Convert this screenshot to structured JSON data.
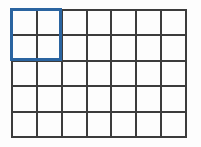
{
  "figure": {
    "title": "",
    "background_color": "#fdfdfd"
  },
  "grid": {
    "columns": 7,
    "rows": 5,
    "total_cells": 35,
    "line_color": "#3c3c3c",
    "line_width_px": 2,
    "cell_fill": "none",
    "origin_px": {
      "x": 11,
      "y": 9
    },
    "size_px": {
      "width": 176,
      "height": 129
    },
    "cell_size_px": {
      "width": 25,
      "height": 25.8
    },
    "cells": [
      {
        "row": 1,
        "col": 1,
        "selected": true
      },
      {
        "row": 1,
        "col": 2,
        "selected": true
      },
      {
        "row": 1,
        "col": 3,
        "selected": false
      },
      {
        "row": 1,
        "col": 4,
        "selected": false
      },
      {
        "row": 1,
        "col": 5,
        "selected": false
      },
      {
        "row": 1,
        "col": 6,
        "selected": false
      },
      {
        "row": 1,
        "col": 7,
        "selected": false
      },
      {
        "row": 2,
        "col": 1,
        "selected": true
      },
      {
        "row": 2,
        "col": 2,
        "selected": true
      },
      {
        "row": 2,
        "col": 3,
        "selected": false
      },
      {
        "row": 2,
        "col": 4,
        "selected": false
      },
      {
        "row": 2,
        "col": 5,
        "selected": false
      },
      {
        "row": 2,
        "col": 6,
        "selected": false
      },
      {
        "row": 2,
        "col": 7,
        "selected": false
      },
      {
        "row": 3,
        "col": 1,
        "selected": false
      },
      {
        "row": 3,
        "col": 2,
        "selected": false
      },
      {
        "row": 3,
        "col": 3,
        "selected": false
      },
      {
        "row": 3,
        "col": 4,
        "selected": false
      },
      {
        "row": 3,
        "col": 5,
        "selected": false
      },
      {
        "row": 3,
        "col": 6,
        "selected": false
      },
      {
        "row": 3,
        "col": 7,
        "selected": false
      },
      {
        "row": 4,
        "col": 1,
        "selected": false
      },
      {
        "row": 4,
        "col": 2,
        "selected": false
      },
      {
        "row": 4,
        "col": 3,
        "selected": false
      },
      {
        "row": 4,
        "col": 4,
        "selected": false
      },
      {
        "row": 4,
        "col": 5,
        "selected": false
      },
      {
        "row": 4,
        "col": 6,
        "selected": false
      },
      {
        "row": 4,
        "col": 7,
        "selected": false
      },
      {
        "row": 5,
        "col": 1,
        "selected": false
      },
      {
        "row": 5,
        "col": 2,
        "selected": false
      },
      {
        "row": 5,
        "col": 3,
        "selected": false
      },
      {
        "row": 5,
        "col": 4,
        "selected": false
      },
      {
        "row": 5,
        "col": 5,
        "selected": false
      },
      {
        "row": 5,
        "col": 6,
        "selected": false
      },
      {
        "row": 5,
        "col": 7,
        "selected": false
      }
    ]
  },
  "selection": {
    "label": "",
    "color": "#2a64a0",
    "border_width_px": 3,
    "span_columns": 2,
    "span_rows": 5,
    "start_row": 1,
    "start_col": 1,
    "end_row": 2,
    "end_col": 2,
    "cells_covered": 4,
    "position_px": {
      "x": 10,
      "y": 8
    },
    "size_px": {
      "width": 52,
      "height": 53
    }
  }
}
